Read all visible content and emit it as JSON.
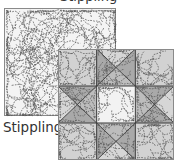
{
  "figure": {
    "cut_off_title": "Stippling",
    "label": "Stippling",
    "panels": [
      {
        "name": "stippling-sample",
        "description": "Plain square covered in meandering dashed stipple stitching"
      },
      {
        "name": "ohio-star-block",
        "description": "Nine-patch star quilt block with stippling over all patches"
      }
    ],
    "colors": {
      "background": "#ffffff",
      "stipple_fill": "#f4f4f4",
      "border": "#8a8a8a",
      "stitch": "#555555",
      "corner_fill": "#d2d2d2",
      "center_fill": "#f2f2f2",
      "star_point_fill": "#a9a9a9",
      "inner_triangle_fill": "#bdbdbd",
      "outer_triangle_fill": "#d6d6d6",
      "seam": "#3a3a3a"
    }
  }
}
